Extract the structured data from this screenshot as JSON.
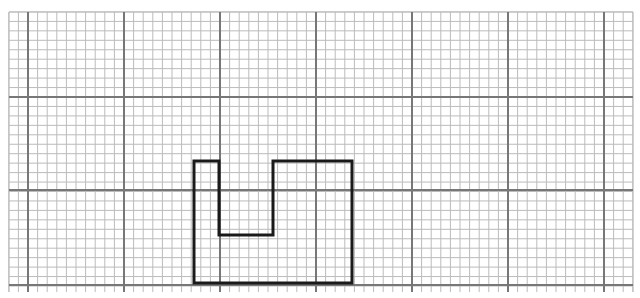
{
  "diagram": {
    "type": "grid-paper-shape",
    "grid": {
      "left": 9,
      "top": 12,
      "right": 633,
      "bottom": 292,
      "minor_spacing_x": 9.6,
      "minor_spacing_y": 9.45,
      "major_x": [
        28,
        124,
        220,
        316,
        412,
        508,
        604
      ],
      "major_y": [
        97,
        190,
        285
      ],
      "minor_color": "#bbbbbb",
      "major_color": "#777777"
    },
    "shape": {
      "stroke": "#1a1a1a",
      "stroke_width": 3,
      "points": [
        [
          194,
          161
        ],
        [
          219,
          161
        ],
        [
          219,
          235
        ],
        [
          273,
          235
        ],
        [
          273,
          161
        ],
        [
          352,
          161
        ],
        [
          352,
          283
        ],
        [
          194,
          283
        ]
      ]
    }
  }
}
